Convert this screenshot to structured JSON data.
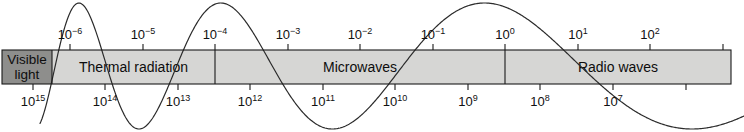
{
  "figure": {
    "name": "electromagnetic-spectrum-band",
    "background": "#ffffff",
    "band": {
      "x": 2,
      "y": 50,
      "width": 729,
      "height": 34,
      "fill_light": "#d6d6d4",
      "fill_dark": "#8e8e8c",
      "stroke": "#1a1a1a"
    },
    "wave": {
      "stroke": "#2b2b2b",
      "stroke_width": 1.2,
      "description": "sine wave of increasing wavelength drawn across the band"
    }
  },
  "top_axis": {
    "name": "wavelength-axis",
    "ticks": [
      {
        "label": "10",
        "exponent": "−6",
        "x": 70
      },
      {
        "label": "10",
        "exponent": "−5",
        "x": 143
      },
      {
        "label": "10",
        "exponent": "−4",
        "x": 215
      },
      {
        "label": "10",
        "exponent": "−3",
        "x": 288
      },
      {
        "label": "10",
        "exponent": "−2",
        "x": 360
      },
      {
        "label": "10",
        "exponent": "−1",
        "x": 433
      },
      {
        "label": "10",
        "exponent": "0",
        "x": 505
      },
      {
        "label": "10",
        "exponent": "1",
        "x": 578
      },
      {
        "label": "10",
        "exponent": "2",
        "x": 650
      },
      {
        "label": "",
        "exponent": "",
        "x": 723
      }
    ]
  },
  "bottom_axis": {
    "name": "frequency-axis",
    "ticks": [
      {
        "label": "10",
        "exponent": "15",
        "x": 33
      },
      {
        "label": "10",
        "exponent": "14",
        "x": 105
      },
      {
        "label": "10",
        "exponent": "13",
        "x": 178
      },
      {
        "label": "10",
        "exponent": "12",
        "x": 250
      },
      {
        "label": "10",
        "exponent": "11",
        "x": 323
      },
      {
        "label": "10",
        "exponent": "10",
        "x": 395
      },
      {
        "label": "10",
        "exponent": "9",
        "x": 468
      },
      {
        "label": "10",
        "exponent": "8",
        "x": 540
      },
      {
        "label": "10",
        "exponent": "7",
        "x": 613
      },
      {
        "label": "",
        "exponent": "",
        "x": 686
      }
    ]
  },
  "bands": [
    {
      "id": "visible-light",
      "line1": "Visible",
      "line2": "light",
      "x": 2,
      "width": 50,
      "shade": "dark",
      "two_line": true
    },
    {
      "id": "thermal-radiation",
      "line1": "Thermal radiation",
      "line2": "",
      "x": 52,
      "width": 163,
      "shade": "light",
      "two_line": false
    },
    {
      "id": "microwaves",
      "line1": "Microwaves",
      "line2": "",
      "x": 215,
      "width": 290,
      "shade": "light",
      "two_line": false
    },
    {
      "id": "radio-waves",
      "line1": "Radio waves",
      "line2": "",
      "x": 505,
      "width": 226,
      "shade": "light",
      "two_line": false
    }
  ]
}
